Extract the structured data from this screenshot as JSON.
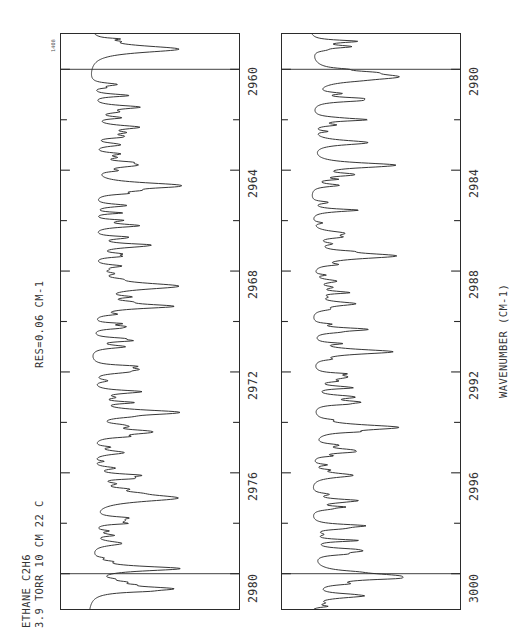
{
  "figure": {
    "corner_code": "1408",
    "header_line1": "ETHANE  C2H6",
    "header_line2": "3.9 TORR  10 CM  22 C",
    "header_line3": "RES=0.06 CM-1",
    "axis_title": "WAVENUMBER (CM-1)",
    "ink_color": "#2b2b2b",
    "background_color": "#ffffff"
  },
  "chart_data": {
    "type": "line",
    "title": "ETHANE  C2H6",
    "subtitle": "3.9 TORR  10 CM  22 C   RES=0.06 CM-1",
    "xlabel": "WAVENUMBER (CM-1)",
    "ylabel": "TRANSMITTANCE",
    "orientation": "rotated-90-ccw",
    "grid": false,
    "legend": null,
    "panels": [
      {
        "name": "upper-panel",
        "xlim": [
          2958.6,
          2981.4
        ],
        "major_ticks": [
          2960,
          2964,
          2968,
          2972,
          2976,
          2980
        ],
        "minor_ticks": [
          2962,
          2966,
          2970,
          2974,
          2978
        ],
        "tick_labels": [
          "2960",
          "2964",
          "2968",
          "2972",
          "2976",
          "2980"
        ],
        "inner_rules": [
          2960,
          2980
        ],
        "ylim": [
          0,
          1
        ],
        "baseline": 0.93,
        "peaks_cm1": [
          2959.2,
          2960.6,
          2961.5,
          2962.3,
          2963.0,
          2963.8,
          2964.6,
          2965.4,
          2966.2,
          2967.0,
          2967.8,
          2968.6,
          2969.4,
          2970.2,
          2971.0,
          2971.9,
          2972.8,
          2973.6,
          2974.4,
          2975.2,
          2976.1,
          2977.0,
          2977.9,
          2978.8,
          2979.8,
          2980.6
        ],
        "strong_peaks_cm1": [
          2959.4,
          2964.4,
          2969.0,
          2973.3,
          2976.6,
          2980.2
        ]
      },
      {
        "name": "lower-panel",
        "xlim": [
          2978.6,
          3001.4
        ],
        "major_ticks": [
          2980,
          2984,
          2988,
          2992,
          2996,
          3000
        ],
        "minor_ticks": [
          2982,
          2986,
          2990,
          2994,
          2998
        ],
        "tick_labels": [
          "2980",
          "2984",
          "2988",
          "2992",
          "2996",
          "3000"
        ],
        "inner_rules": [
          2980,
          3000
        ],
        "ylim": [
          0,
          1
        ],
        "baseline": 0.93,
        "peaks_cm1": [
          2979.1,
          2980.3,
          2981.2,
          2982.0,
          2982.9,
          2983.8,
          2984.6,
          2985.6,
          2986.5,
          2987.4,
          2988.4,
          2989.3,
          2990.3,
          2991.2,
          2992.2,
          2993.2,
          2994.2,
          2995.1,
          2996.1,
          2997.1,
          2998.1,
          2999.1,
          3000.1,
          3000.9
        ],
        "strong_peaks_cm1": [
          2980.2,
          2984.1,
          2987.6,
          2990.9,
          2993.9,
          2996.6,
          3000.0
        ]
      }
    ]
  }
}
